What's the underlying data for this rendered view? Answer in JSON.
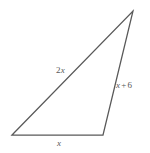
{
  "figure": {
    "type": "triangle-diagram",
    "background_color": "#ffffff",
    "stroke_color": "#595959",
    "label_color": "#585858",
    "vertices": {
      "apex": {
        "x": 133,
        "y": 11
      },
      "bottom_left": {
        "x": 12,
        "y": 135
      },
      "bottom_right": {
        "x": 103,
        "y": 135
      }
    },
    "sides": [
      {
        "name": "hypotenuse",
        "label": "2x",
        "coefficient": "2",
        "variable": "x",
        "from": "bottom_left",
        "to": "apex"
      },
      {
        "name": "right-side",
        "label": "x + 6",
        "variable": "x",
        "operator": "+",
        "constant": "6",
        "from": "apex",
        "to": "bottom_right"
      },
      {
        "name": "base",
        "label": "x",
        "variable": "x",
        "from": "bottom_left",
        "to": "bottom_right"
      }
    ]
  },
  "labels": {
    "hypotenuse": {
      "coefficient": "2",
      "variable": "x"
    },
    "right_side": {
      "variable": "x",
      "operator": "+",
      "constant": "6"
    },
    "base": {
      "variable": "x"
    }
  }
}
